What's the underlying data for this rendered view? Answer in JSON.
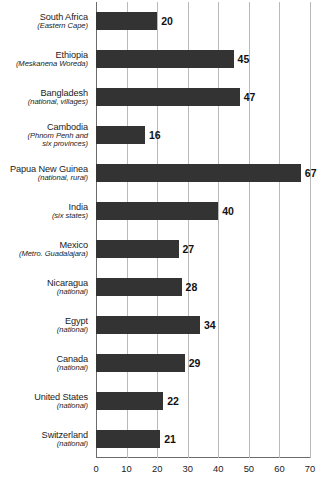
{
  "chart_data": {
    "type": "bar",
    "orientation": "horizontal",
    "title": "",
    "subtitle": "",
    "xlabel": "",
    "ylabel": "",
    "xlim": [
      0,
      70
    ],
    "xticks": [
      0,
      10,
      20,
      30,
      40,
      50,
      60,
      70
    ],
    "tick_labels": [
      "0",
      "10",
      "20",
      "30",
      "40",
      "50",
      "60",
      "70"
    ],
    "grid": "vertical",
    "legend": "none",
    "bar_color": "#333333",
    "gridline_color": "#b9b9b9",
    "axis_color": "#6b6b6b",
    "categories": [
      "South Africa",
      "Ethiopia",
      "Bangladesh",
      "Cambodia",
      "Papua New Guinea",
      "India",
      "Mexico",
      "Nicaragua",
      "Egypt",
      "Canada",
      "United States",
      "Switzerland"
    ],
    "category_sublabels": [
      [
        "(Eastern Cape)"
      ],
      [
        "(Meskanena Woreda)"
      ],
      [
        "(national, villages)"
      ],
      [
        "(Phnom Penh and",
        "six provinces)"
      ],
      [
        "(national, rural)"
      ],
      [
        "(six states)"
      ],
      [
        "(Metro. Guadalajara)"
      ],
      [
        "(national)"
      ],
      [
        "(national)"
      ],
      [
        "(national)"
      ],
      [
        "(national)"
      ],
      [
        "(national)"
      ]
    ],
    "values": [
      20,
      45,
      47,
      16,
      67,
      40,
      27,
      28,
      34,
      29,
      22,
      21
    ],
    "value_labels": [
      "20",
      "45",
      "47",
      "16",
      "67",
      "40",
      "27",
      "28",
      "34",
      "29",
      "22",
      "21"
    ]
  }
}
